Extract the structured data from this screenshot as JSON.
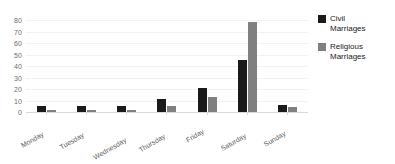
{
  "chart_data": {
    "type": "bar",
    "title": "",
    "xlabel": "",
    "ylabel": "",
    "ylim": [
      0,
      80
    ],
    "yticks": [
      0,
      10,
      20,
      30,
      40,
      50,
      60,
      70,
      80
    ],
    "grid": true,
    "legend_position": "right",
    "categories": [
      "Monday",
      "Tuesday",
      "Wednesday",
      "Thursday",
      "Friday",
      "Saturday",
      "Sunday"
    ],
    "series": [
      {
        "name": "Civil Marriages",
        "color": "#1a1a1a",
        "values": [
          5,
          5,
          5,
          11,
          21,
          45,
          6
        ]
      },
      {
        "name": "Religious Marriages",
        "color": "#808080",
        "values": [
          2,
          2,
          2,
          5,
          13,
          78,
          4
        ]
      }
    ]
  },
  "legend": {
    "entries": [
      {
        "label": "Civil\nMarriages",
        "swatch": "civil-swatch"
      },
      {
        "label": "Religious\nMarriages",
        "swatch": "religious-swatch"
      }
    ]
  }
}
